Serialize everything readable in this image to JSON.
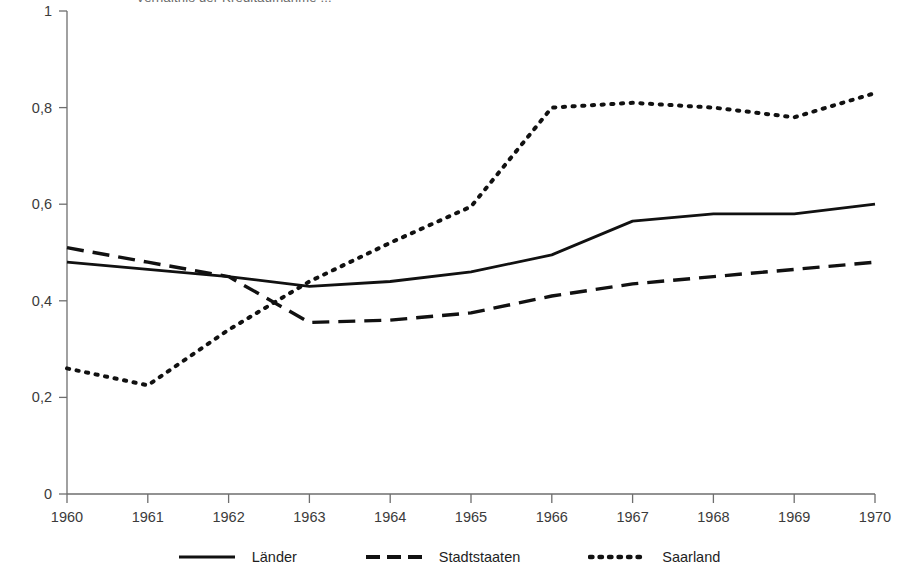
{
  "chart_data": {
    "type": "line",
    "title": "Verhältnis der Kreditaufnahme ...",
    "xlabel": "",
    "ylabel": "",
    "x": [
      1960,
      1961,
      1962,
      1963,
      1964,
      1965,
      1966,
      1967,
      1968,
      1969,
      1970
    ],
    "xtick_labels": [
      "1960",
      "1961",
      "1962",
      "1963",
      "1964",
      "1965",
      "1966",
      "1967",
      "1968",
      "1969",
      "1970"
    ],
    "ytick_labels": [
      "0",
      "0,2",
      "0,4",
      "0,6",
      "0,8",
      "1"
    ],
    "ytick_values": [
      0,
      0.2,
      0.4,
      0.6,
      0.8,
      1
    ],
    "ylim": [
      0,
      1
    ],
    "xlim": [
      1960,
      1970
    ],
    "grid": false,
    "legend_position": "bottom",
    "series": [
      {
        "name": "Länder",
        "style": "solid",
        "color": "#111111",
        "values": [
          0.48,
          0.465,
          0.45,
          0.43,
          0.44,
          0.46,
          0.495,
          0.565,
          0.58,
          0.58,
          0.6
        ]
      },
      {
        "name": "Stadtstaaten",
        "style": "dashed",
        "color": "#111111",
        "values": [
          0.51,
          0.48,
          0.45,
          0.355,
          0.36,
          0.375,
          0.41,
          0.435,
          0.45,
          0.465,
          0.48
        ]
      },
      {
        "name": "Saarland",
        "style": "dotted",
        "color": "#111111",
        "values": [
          0.26,
          0.225,
          0.34,
          0.44,
          0.52,
          0.595,
          0.8,
          0.81,
          0.8,
          0.78,
          0.83
        ]
      }
    ]
  },
  "legend": {
    "items": [
      {
        "label": "Länder"
      },
      {
        "label": "Stadtstaaten"
      },
      {
        "label": "Saarland"
      }
    ]
  }
}
